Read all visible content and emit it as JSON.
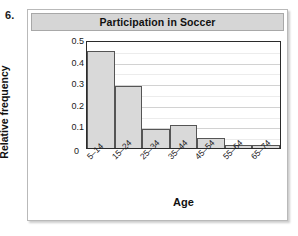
{
  "exercise": {
    "number": "6."
  },
  "chart_data": {
    "type": "bar",
    "title": "Participation in Soccer",
    "xlabel": "Age",
    "ylabel": "Relative frequency",
    "categories": [
      "5–14",
      "15–24",
      "25–34",
      "35–44",
      "45–54",
      "55–64",
      "65–74"
    ],
    "values": [
      0.45,
      0.285,
      0.09,
      0.105,
      0.045,
      0.015,
      0.012
    ],
    "ylim": [
      0,
      0.5
    ],
    "ytick_labels": [
      "0.5",
      "0.4",
      "0.3",
      "0.2",
      "0.1",
      "0"
    ],
    "ytick_values": [
      0.5,
      0.4,
      0.3,
      0.2,
      0.1,
      0
    ],
    "zero_label": "0",
    "grid": true,
    "grid_minor_step": 0.05,
    "legend": null,
    "bar_fill_color": "#d9d9d9",
    "bar_border_color": "#555555",
    "title_bar_color": "#d6d6d6"
  }
}
